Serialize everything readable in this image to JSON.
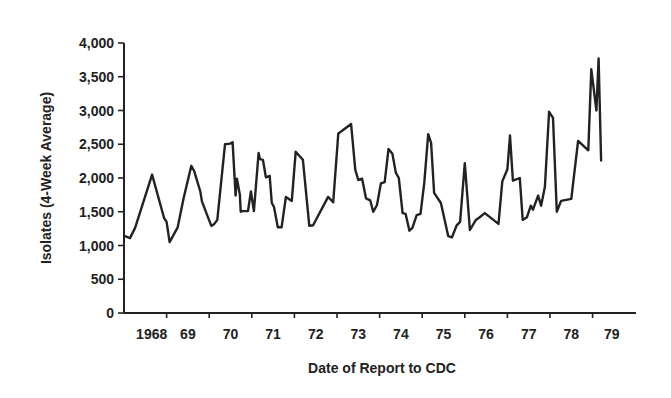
{
  "chart_data": {
    "type": "line",
    "title": "",
    "xlabel": "Date of Report to CDC",
    "ylabel": "Isolates (4-Week Average)",
    "ylim": [
      0,
      4000
    ],
    "xlim": [
      1968.0,
      1979.95
    ],
    "grid": false,
    "legend": null,
    "y_ticks": [
      0,
      500,
      1000,
      1500,
      2000,
      2500,
      3000,
      3500,
      4000
    ],
    "y_tick_labels": [
      "0",
      "500",
      "1,000",
      "1,500",
      "2,000",
      "2,500",
      "3,000",
      "3,500",
      "4,000"
    ],
    "x_tick_positions": [
      1969,
      1970,
      1971,
      1972,
      1973,
      1974,
      1975,
      1976,
      1977,
      1978,
      1979
    ],
    "x_labels": [
      {
        "label": "1968",
        "at": 1968.65
      },
      {
        "label": "69",
        "at": 1969.5
      },
      {
        "label": "70",
        "at": 1970.5
      },
      {
        "label": "71",
        "at": 1971.5
      },
      {
        "label": "72",
        "at": 1972.5
      },
      {
        "label": "73",
        "at": 1973.5
      },
      {
        "label": "74",
        "at": 1974.5
      },
      {
        "label": "75",
        "at": 1975.5
      },
      {
        "label": "76",
        "at": 1976.5
      },
      {
        "label": "77",
        "at": 1977.5
      },
      {
        "label": "78",
        "at": 1978.5
      },
      {
        "label": "79",
        "at": 1979.45
      }
    ],
    "series": [
      {
        "name": "Isolates (4-week average)",
        "x": [
          1968.02,
          1968.14,
          1968.26,
          1968.66,
          1968.94,
          1969.0,
          1969.07,
          1969.26,
          1969.4,
          1969.58,
          1969.65,
          1969.79,
          1969.83,
          1970.05,
          1970.12,
          1970.19,
          1970.37,
          1970.49,
          1970.55,
          1970.62,
          1970.65,
          1970.72,
          1970.74,
          1970.77,
          1970.91,
          1970.98,
          1971.05,
          1971.16,
          1971.19,
          1971.26,
          1971.33,
          1971.42,
          1971.47,
          1971.52,
          1971.61,
          1971.7,
          1971.8,
          1971.94,
          1972.03,
          1972.2,
          1972.35,
          1972.44,
          1972.79,
          1972.91,
          1973.03,
          1973.12,
          1973.33,
          1973.43,
          1973.5,
          1973.59,
          1973.68,
          1973.78,
          1973.85,
          1973.94,
          1974.03,
          1974.12,
          1974.21,
          1974.3,
          1974.38,
          1974.45,
          1974.54,
          1974.61,
          1974.7,
          1974.77,
          1974.87,
          1974.96,
          1975.05,
          1975.14,
          1975.21,
          1975.28,
          1975.44,
          1975.61,
          1975.7,
          1975.81,
          1975.89,
          1976.0,
          1976.12,
          1976.26,
          1976.35,
          1976.47,
          1976.79,
          1976.88,
          1977.0,
          1977.06,
          1977.13,
          1977.29,
          1977.36,
          1977.46,
          1977.55,
          1977.6,
          1977.72,
          1977.79,
          1977.88,
          1977.98,
          1978.07,
          1978.16,
          1978.26,
          1978.5,
          1978.66,
          1978.9,
          1978.97,
          1979.09,
          1979.14,
          1979.2,
          1979.3,
          1979.39,
          1979.49,
          1979.58,
          1979.72
        ],
        "values": [
          1140,
          1110,
          1260,
          2050,
          1410,
          1350,
          1050,
          1270,
          1700,
          2180,
          2100,
          1800,
          1650,
          1290,
          1320,
          1380,
          2500,
          2510,
          2530,
          1740,
          1990,
          1750,
          1500,
          1510,
          1510,
          1800,
          1510,
          2370,
          2280,
          2270,
          2010,
          2030,
          1630,
          1570,
          1270,
          1270,
          1720,
          1660,
          2390,
          2270,
          1290,
          1300,
          1720,
          1640,
          2660,
          2700,
          2800,
          2120,
          1970,
          1990,
          1700,
          1670,
          1500,
          1600,
          1920,
          1940,
          2430,
          2360,
          2080,
          2000,
          1480,
          1470,
          1220,
          1260,
          1450,
          1470,
          1930,
          2650,
          2520,
          1780,
          1630,
          1140,
          1120,
          1300,
          1350,
          2220,
          1230,
          1380,
          1420,
          1480,
          1320,
          1950,
          2130,
          2630,
          1960,
          2000,
          1380,
          1420,
          1590,
          1530,
          1740,
          1590,
          1870,
          2980,
          2890,
          1500,
          1660,
          1690,
          2550,
          2410,
          3610,
          3000,
          3770,
          2260,
          2260,
          2260,
          2260,
          2260,
          2260
        ],
        "color": "#222222"
      }
    ]
  },
  "layout": {
    "plot_left_px": 124,
    "plot_bottom_px": 313,
    "plot_top_px": 43,
    "plot_right_px": 636,
    "px_per_year": 42.6
  },
  "colors": {
    "line": "#222222",
    "axis": "#222222",
    "background": "#ffffff"
  }
}
